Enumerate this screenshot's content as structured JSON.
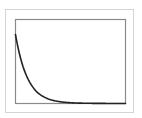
{
  "chart_data": {
    "type": "line",
    "title": "",
    "xlabel": "",
    "ylabel": "",
    "grid": false,
    "legend": null,
    "xlim": [
      0,
      10
    ],
    "ylim": [
      0,
      1
    ],
    "series": [
      {
        "name": "exponential decay",
        "x": [
          0,
          0.5,
          1,
          1.5,
          2,
          2.5,
          3,
          3.5,
          4,
          4.5,
          5,
          6,
          7,
          8,
          9,
          10
        ],
        "values": [
          0.82,
          0.52,
          0.33,
          0.21,
          0.13,
          0.085,
          0.054,
          0.034,
          0.022,
          0.014,
          0.009,
          0.004,
          0.002,
          0.001,
          0.0005,
          0.0002
        ]
      }
    ]
  },
  "colors": {
    "line": "#222222",
    "axes_frame": "#8a8a8a",
    "outer_frame": "#d4d4d4",
    "background": "#ffffff"
  }
}
